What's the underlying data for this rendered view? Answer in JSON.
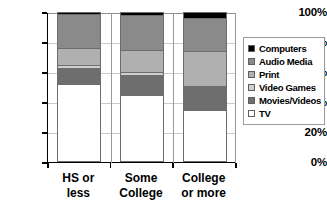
{
  "chart_data": {
    "type": "bar",
    "stacked": true,
    "stack_mode": "percent",
    "title": "",
    "subtitle": "",
    "xlabel": "",
    "ylabel": "",
    "ylim": [
      0,
      100
    ],
    "y_tick_labels": [
      "0%",
      "20%",
      "40%",
      "60%",
      "80%",
      "100%"
    ],
    "y_tick_values": [
      0,
      20,
      40,
      60,
      80,
      100
    ],
    "grid": true,
    "legend_position": "right",
    "categories": [
      "HS or less",
      "Some College",
      "College or more"
    ],
    "category_lines": [
      [
        "HS or",
        "less"
      ],
      [
        "Some",
        "College"
      ],
      [
        "College",
        "or more"
      ]
    ],
    "series": [
      {
        "name": "TV",
        "color": "#ffffff",
        "values": [
          52,
          45,
          35
        ]
      },
      {
        "name": "Movies/Videos",
        "color": "#6e6e6e",
        "values": [
          11,
          13,
          15
        ]
      },
      {
        "name": "Video Games",
        "color": "#cfcfcf",
        "values": [
          2,
          2,
          1
        ]
      },
      {
        "name": "Print",
        "color": "#b0b0b0",
        "values": [
          11,
          15,
          23
        ]
      },
      {
        "name": "Audio Media",
        "color": "#8a8a8a",
        "values": [
          23,
          23,
          22
        ]
      },
      {
        "name": "Computers",
        "color": "#000000",
        "values": [
          1,
          2,
          4
        ]
      }
    ],
    "legend_entries": [
      {
        "label": "Computers",
        "color": "#000000"
      },
      {
        "label": "Audio Media",
        "color": "#8a8a8a"
      },
      {
        "label": "Print",
        "color": "#b0b0b0"
      },
      {
        "label": "Video Games",
        "color": "#cfcfcf"
      },
      {
        "label": "Movies/Videos",
        "color": "#6e6e6e"
      },
      {
        "label": "TV",
        "color": "#ffffff"
      }
    ]
  }
}
